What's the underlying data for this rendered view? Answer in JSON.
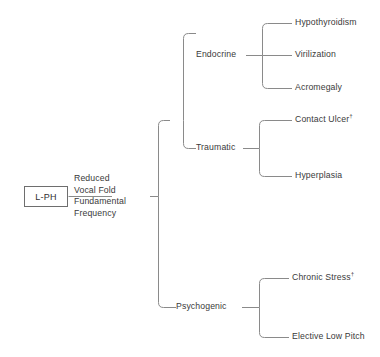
{
  "figure": {
    "type": "hierarchy-tree",
    "orientation": "horizontal-left-to-right",
    "line_color": "#8a8a8a",
    "text_color": "#3a3a3a",
    "background": "#ffffff"
  },
  "root": {
    "box_label": "L-PH",
    "stem_label": "Reduced\nVocal Fold\nFundamental\nFrequency"
  },
  "branches": [
    {
      "label": "Endocrine",
      "leaves": [
        {
          "label": "Hypothyroidism",
          "marker": ""
        },
        {
          "label": "Virilization",
          "marker": ""
        },
        {
          "label": "Acromegaly",
          "marker": ""
        }
      ]
    },
    {
      "label": "Traumatic",
      "leaves": [
        {
          "label": "Contact Ulcer",
          "marker": "†"
        },
        {
          "label": "Hyperplasia",
          "marker": ""
        }
      ]
    },
    {
      "label": "Psychogenic",
      "leaves": [
        {
          "label": "Chronic Stress",
          "marker": "†"
        },
        {
          "label": "Elective Low Pitch",
          "marker": ""
        }
      ]
    }
  ]
}
